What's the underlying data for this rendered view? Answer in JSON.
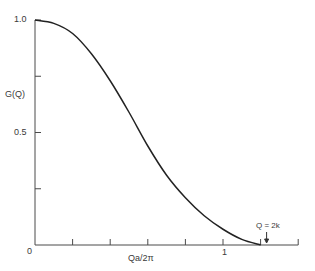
{
  "chart_data": {
    "type": "line",
    "title": "",
    "xlabel": "Qa/2π",
    "ylabel": "G(Q)",
    "xlim": [
      0,
      1.4
    ],
    "ylim": [
      0,
      1.0
    ],
    "grid": false,
    "x_ticks": [
      0,
      0.2,
      0.4,
      0.6,
      0.8,
      1.0,
      1.2,
      1.4
    ],
    "x_tick_labels": {
      "0": "0",
      "1.0": "1"
    },
    "y_ticks": [
      0,
      0.25,
      0.5,
      0.75,
      1.0
    ],
    "y_tick_labels": {
      "0": "0",
      "0.5": "0.5",
      "1.0": "1.0"
    },
    "series": [
      {
        "name": "G(Q)",
        "x": [
          0.0,
          0.1,
          0.2,
          0.3,
          0.4,
          0.5,
          0.6,
          0.7,
          0.8,
          0.9,
          1.0,
          1.1,
          1.2
        ],
        "values": [
          1.0,
          0.985,
          0.94,
          0.85,
          0.73,
          0.59,
          0.44,
          0.31,
          0.21,
          0.13,
          0.07,
          0.025,
          0.0
        ]
      }
    ],
    "annotations": [
      {
        "text": "Q = 2k",
        "x": 1.2,
        "y": 0.0,
        "arrow": "down"
      }
    ]
  },
  "labels": {
    "y_axis_title": "G(Q)",
    "x_axis_title": "Qa/2π",
    "y_top": "1.0",
    "y_mid": "0.5",
    "origin": "0",
    "x_one": "1",
    "annotation": "Q = 2k"
  }
}
